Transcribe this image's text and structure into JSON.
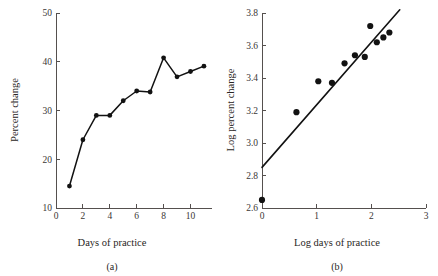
{
  "figure": {
    "panels": [
      {
        "caption": "(a)",
        "xlabel": "Days of practice",
        "ylabel": "Percent change"
      },
      {
        "caption": "(b)",
        "xlabel": "Log days of practice",
        "ylabel": "Log percent change"
      }
    ]
  },
  "chart_data": [
    {
      "type": "line",
      "title": "",
      "subtitle": "",
      "panel_label": "(a)",
      "xlabel": "Days of practice",
      "ylabel": "Percent change",
      "x": [
        1,
        2,
        3,
        4,
        5,
        6,
        7,
        8,
        9,
        10,
        11
      ],
      "values": [
        14.5,
        24.0,
        29.0,
        29.0,
        32.0,
        34.0,
        33.8,
        40.8,
        36.9,
        38.0,
        39.1
      ],
      "xlim": [
        0,
        11.6
      ],
      "ylim": [
        10,
        50
      ],
      "xticks": [
        0,
        2,
        4,
        6,
        8,
        10
      ],
      "xtick_labels": [
        "0",
        "2",
        "4",
        "6",
        "8",
        "10"
      ],
      "yticks": [
        10,
        20,
        30,
        40,
        50
      ],
      "ytick_labels": [
        "10",
        "20",
        "30",
        "40",
        "50"
      ],
      "grid": false,
      "legend": "none",
      "markers": "filled-circle",
      "line_color": "#121212",
      "marker_color": "#121212"
    },
    {
      "type": "scatter",
      "title": "",
      "subtitle": "",
      "panel_label": "(b)",
      "xlabel": "Log days of practice",
      "ylabel": "Log percent change",
      "x": [
        0.0,
        0.63,
        1.03,
        1.28,
        1.51,
        1.7,
        1.88,
        1.98,
        2.1,
        2.22,
        2.33
      ],
      "values": [
        2.65,
        3.19,
        3.38,
        3.37,
        3.49,
        3.54,
        3.53,
        3.72,
        3.62,
        3.65,
        3.68
      ],
      "xlim": [
        0,
        3
      ],
      "ylim": [
        2.6,
        3.8
      ],
      "xticks": [
        0,
        1,
        2,
        3
      ],
      "xtick_labels": [
        "0",
        "1",
        "2",
        "3"
      ],
      "yticks": [
        2.6,
        2.8,
        3.0,
        3.2,
        3.4,
        3.6,
        3.8
      ],
      "ytick_labels": [
        "2.6",
        "2.8",
        "3.0",
        "3.2",
        "3.4",
        "3.6",
        "3.8"
      ],
      "grid": false,
      "legend": "none",
      "markers": "filled-circle",
      "marker_color": "#121212",
      "fit_line": {
        "x": [
          0.0,
          2.52
        ],
        "y": [
          2.85,
          3.82
        ],
        "color": "#121212"
      }
    }
  ]
}
